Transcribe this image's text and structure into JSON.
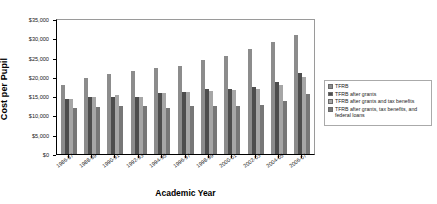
{
  "chart_data": {
    "type": "bar",
    "title": "",
    "xlabel": "Academic Year",
    "ylabel": "Cost per Pupil",
    "ylim": [
      0,
      35000
    ],
    "ytick_labels": [
      "$35,000",
      "$30,000",
      "$25,000",
      "$20,000",
      "$15,000",
      "$10,000",
      "$5,000",
      "$0"
    ],
    "ytick_values": [
      35000,
      30000,
      25000,
      20000,
      15000,
      10000,
      5000,
      0
    ],
    "grid": false,
    "legend_position": "right",
    "categories": [
      "1986-87",
      "1988-89",
      "1990-91",
      "1992-93",
      "1994-95",
      "1996-97",
      "1998-99",
      "2000-01",
      "2002-03",
      "2004-05",
      "2006-07"
    ],
    "series": [
      {
        "name": "TFRB",
        "color": "#8c8c8c",
        "values": [
          18000,
          19700,
          20700,
          21500,
          22200,
          22900,
          24300,
          25500,
          27200,
          29100,
          30800
        ]
      },
      {
        "name": "TFRB after grants",
        "color": "#4d4d4d",
        "values": [
          14200,
          14900,
          14900,
          14900,
          15700,
          16100,
          16800,
          16900,
          17400,
          18800,
          21100
        ]
      },
      {
        "name": "TFRB after grants and tax benefits",
        "color": "#a6a6a6",
        "values": [
          14200,
          14900,
          15300,
          14900,
          15700,
          16100,
          16400,
          16500,
          16900,
          18000,
          20000
        ]
      },
      {
        "name": "TFRB after grants, tax benefits, and federal loans",
        "color": "#777777",
        "values": [
          12000,
          12300,
          12500,
          12500,
          11900,
          12400,
          12400,
          12400,
          12700,
          13800,
          15500
        ]
      }
    ]
  },
  "axis": {
    "y_title": "Cost per Pupil",
    "x_title": "Academic Year"
  },
  "legend": {
    "items": [
      {
        "label": "TFRB",
        "color": "#8c8c8c"
      },
      {
        "label": "TFRB after grants",
        "color": "#4d4d4d"
      },
      {
        "label": "TFRB after grants and tax benefits",
        "color": "#a6a6a6"
      },
      {
        "label": "TFRB after grants, tax benefits, and federal loans",
        "color": "#777777"
      }
    ]
  }
}
